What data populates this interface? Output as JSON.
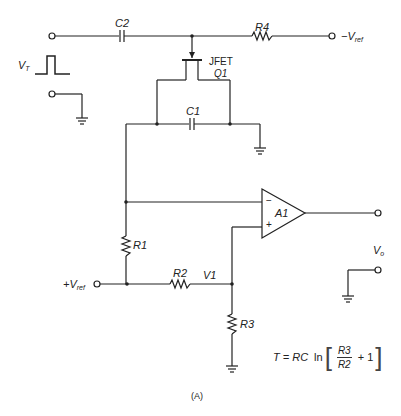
{
  "diagram": {
    "type": "circuit-schematic",
    "caption": "(A)",
    "components": {
      "c2": "C2",
      "r4": "R4",
      "jfet_line1": "JFET",
      "jfet_line2": "Q1",
      "c1": "C1",
      "r1": "R1",
      "r2": "R2",
      "r3": "R3",
      "opamp": "A1",
      "opamp_minus": "−",
      "opamp_plus": "+"
    },
    "terminals": {
      "neg_vref_sign": "−V",
      "neg_vref_sub": "ref",
      "pos_vref_sign": "+V",
      "pos_vref_sub": "ref",
      "vt_main": "V",
      "vt_sub": "T",
      "vo_main": "V",
      "vo_sub": "o"
    },
    "nodes": {
      "v1": "V1"
    },
    "formula": {
      "lhs": "T = ",
      "rc": "RC",
      "ln": "ln",
      "open_bracket": "[",
      "numerator": "R3",
      "denominator": "R2",
      "plus_one": "+ 1",
      "close_bracket": "]"
    }
  }
}
